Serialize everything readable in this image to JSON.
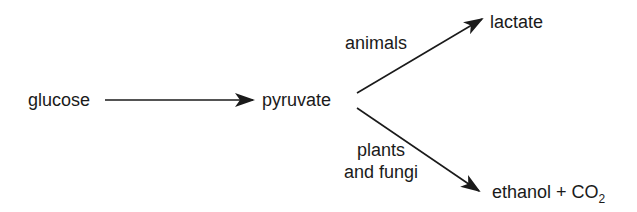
{
  "diagram": {
    "nodes": {
      "glucose": "glucose",
      "pyruvate": "pyruvate",
      "lactate": "lactate",
      "ethanol_co2": {
        "main": "ethanol + CO",
        "subscript": "2"
      }
    },
    "edges": [
      {
        "from": "glucose",
        "to": "pyruvate",
        "label": ""
      },
      {
        "from": "pyruvate",
        "to": "lactate",
        "label": "animals"
      },
      {
        "from": "pyruvate",
        "to": "ethanol_co2",
        "label_lines": [
          "plants",
          "and fungi"
        ]
      }
    ],
    "colors": {
      "ink": "#1a1a1a",
      "background": "#ffffff"
    }
  }
}
